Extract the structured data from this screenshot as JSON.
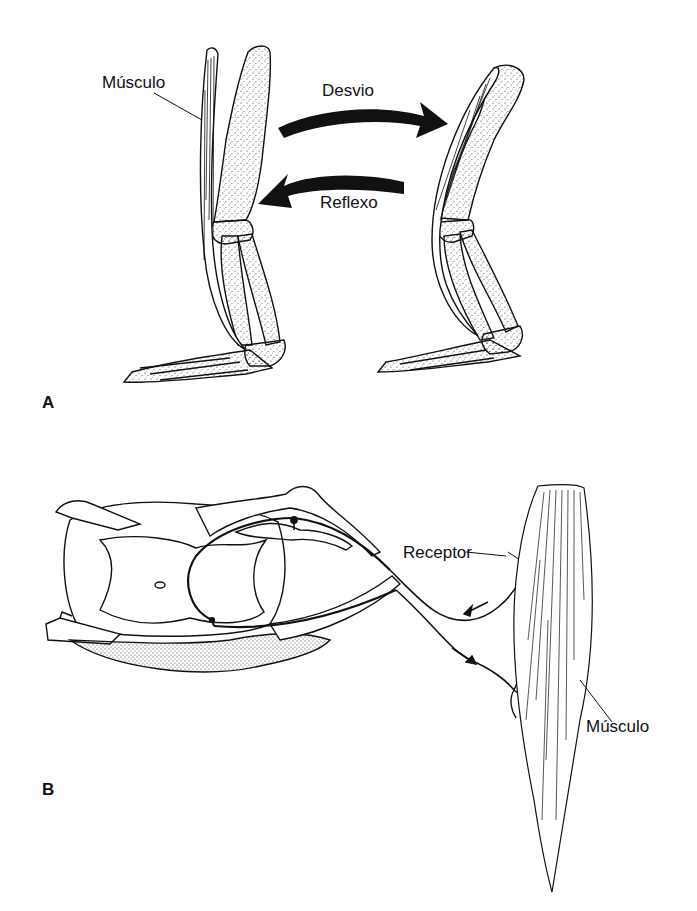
{
  "figure": {
    "panels": [
      {
        "id": "A",
        "label": "A",
        "labels": {
          "muscle": "Músculo",
          "deflection": "Desvio",
          "reflex": "Reflexo"
        }
      },
      {
        "id": "B",
        "label": "B",
        "labels": {
          "receptor": "Receptor",
          "muscle": "Músculo"
        }
      }
    ]
  }
}
